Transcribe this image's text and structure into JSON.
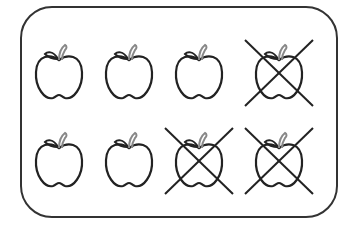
{
  "figure": {
    "rows": [
      {
        "apples": [
          {
            "crossed": false
          },
          {
            "crossed": false
          },
          {
            "crossed": false
          },
          {
            "crossed": true
          }
        ]
      },
      {
        "apples": [
          {
            "crossed": false
          },
          {
            "crossed": false
          },
          {
            "crossed": true
          },
          {
            "crossed": true
          }
        ]
      }
    ],
    "total_apples": 8,
    "crossed_out": 3,
    "remaining": 5,
    "colors": {
      "stroke": "#222222",
      "stem": "#888888",
      "background": "#ffffff"
    }
  }
}
